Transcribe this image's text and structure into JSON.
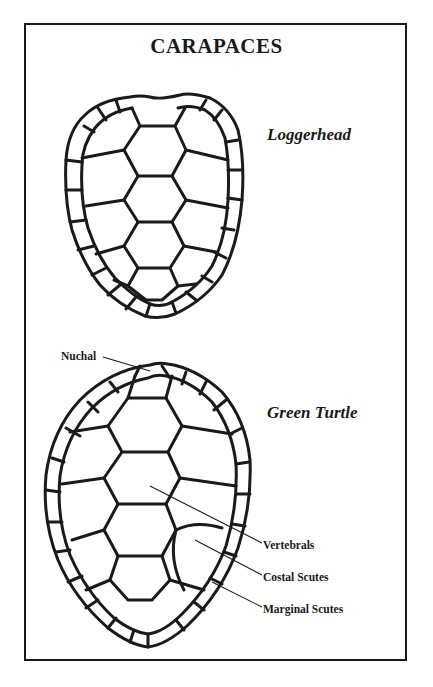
{
  "title": "CARAPACES",
  "diagrams": [
    {
      "species": "Loggerhead"
    },
    {
      "species": "Green Turtle"
    }
  ],
  "labels": {
    "nuchal": "Nuchal",
    "vertebrals": "Vertebrals",
    "costal": "Costal Scutes",
    "marginal": "Marginal Scutes"
  },
  "colors": {
    "ink": "#1a1a1a",
    "background": "#ffffff"
  }
}
